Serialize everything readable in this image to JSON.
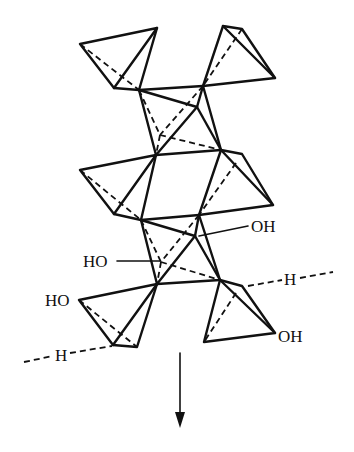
{
  "diagram": {
    "type": "polyhedral-chain-structure",
    "labels": {
      "oh_upper_right": "OH",
      "ho_middle_left": "HO",
      "ho_lower_left": "HO",
      "oh_lower_right": "OH",
      "h_right": "H",
      "h_left": "H"
    },
    "arrow": {
      "direction": "down"
    }
  }
}
